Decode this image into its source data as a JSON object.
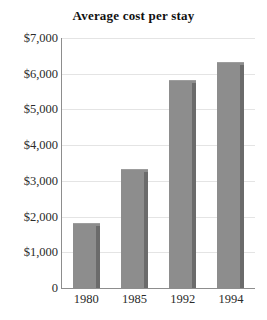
{
  "chart_data": {
    "type": "bar",
    "title": "Average cost per stay",
    "xlabel": "",
    "ylabel": "",
    "categories": [
      "1980",
      "1985",
      "1992",
      "1994"
    ],
    "values": [
      1800,
      3300,
      5800,
      6300
    ],
    "ylim": [
      0,
      7000
    ],
    "ytick_values": [
      7000,
      6000,
      5000,
      4000,
      3000,
      2000,
      1000,
      0
    ],
    "ytick_labels": [
      "$7,000",
      "$6,000",
      "$5,000",
      "$4,000",
      "$3,000",
      "$2,000",
      "$1,000",
      "0"
    ],
    "grid": true,
    "legend": false,
    "legend_position": "none",
    "bar_color": "#8d8d8d",
    "bar_shadow_color": "#6b6b6b",
    "gridline_color": "#e4e4e4",
    "axis_color": "#8d8d8d",
    "background_color": "#ffffff",
    "title_color": "#111111"
  }
}
